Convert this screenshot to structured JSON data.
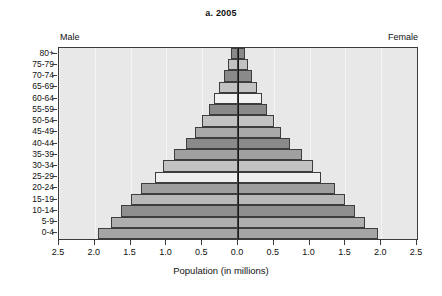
{
  "chart_data": {
    "type": "bar",
    "title": "a. 2005",
    "subtitle": "",
    "xlabel": "Population (in millions)",
    "ylabel": "",
    "orientation": "horizontal-diverging",
    "xlim": [
      -2.5,
      2.5
    ],
    "axis_max": 2.5,
    "xticks": [
      2.5,
      2.0,
      1.5,
      1.0,
      0.5,
      0.0,
      0.5,
      1.0,
      1.5,
      2.0,
      2.5
    ],
    "xtick_labels": [
      "2.5",
      "2.0",
      "1.5",
      "1.0",
      "0.5",
      "0.0",
      "0.5",
      "1.0",
      "1.5",
      "2.0",
      "2.5"
    ],
    "grid": true,
    "legend": [
      "Male",
      "Female"
    ],
    "legend_position": "top-outside",
    "left_series_label": "Male",
    "right_series_label": "Female",
    "categories": [
      "80+",
      "75-79",
      "70-74",
      "65-69",
      "60-64",
      "55-59",
      "50-54",
      "45-49",
      "40-44",
      "35-39",
      "30-34",
      "25-29",
      "20-24",
      "15-19",
      "10-14",
      "5-9",
      "0-4"
    ],
    "series": [
      {
        "name": "Male",
        "values": [
          0.1,
          0.14,
          0.2,
          0.26,
          0.33,
          0.41,
          0.5,
          0.6,
          0.72,
          0.9,
          1.05,
          1.16,
          1.35,
          1.5,
          1.63,
          1.78,
          1.95
        ]
      },
      {
        "name": "Female",
        "values": [
          0.1,
          0.14,
          0.2,
          0.26,
          0.33,
          0.41,
          0.5,
          0.6,
          0.72,
          0.9,
          1.05,
          1.16,
          1.35,
          1.5,
          1.63,
          1.78,
          1.95
        ]
      }
    ],
    "bar_fills": [
      "#8a8a8a",
      "#c2c2c2",
      "#8a8a8a",
      "#c2c2c2",
      "#f2f2f2",
      "#8a8a8a",
      "#c2c2c2",
      "#a8a8a8",
      "#8a8a8a",
      "#a0a0a0",
      "#c2c2c2",
      "#efefef",
      "#9e9e9e",
      "#b8b8b8",
      "#8f8f8f",
      "#aeaeae",
      "#a5a5a5"
    ],
    "colors": {
      "plot_background": "#e8e8e8",
      "page_background": "#ffffff",
      "axis": "#3b3b3b",
      "gridline": "#f4f4f4",
      "centerline": "#1a1a1a",
      "text": "#111111",
      "bar_border": "#3d3d3d"
    }
  }
}
